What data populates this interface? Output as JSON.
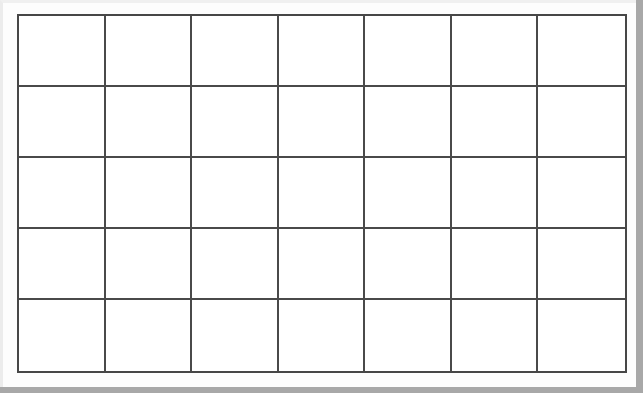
{
  "grid": {
    "columns": 7,
    "rows": 5,
    "line_color": "#4a4a4a",
    "cell_color": "#ffffff",
    "cells": [
      [
        "",
        "",
        "",
        "",
        "",
        "",
        ""
      ],
      [
        "",
        "",
        "",
        "",
        "",
        "",
        ""
      ],
      [
        "",
        "",
        "",
        "",
        "",
        "",
        ""
      ],
      [
        "",
        "",
        "",
        "",
        "",
        "",
        ""
      ],
      [
        "",
        "",
        "",
        "",
        "",
        "",
        ""
      ]
    ]
  }
}
